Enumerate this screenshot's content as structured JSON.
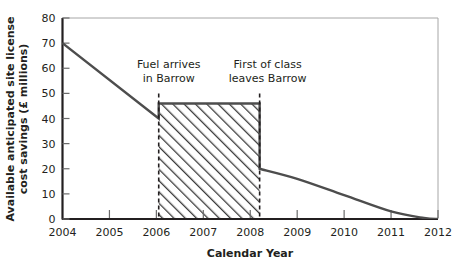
{
  "chart_data": {
    "type": "area",
    "title": "",
    "xlabel": "Calendar Year",
    "ylabel": "Available anticipated site license cost savings (£ millions)",
    "ylabel_line1": "Available anticipated site license",
    "ylabel_line2": "cost savings (£ millions)",
    "xlim": [
      2004,
      2012
    ],
    "ylim": [
      0,
      80
    ],
    "x_ticks": [
      "2004",
      "2005",
      "2006",
      "2007",
      "2008",
      "2009",
      "2010",
      "2011",
      "2012"
    ],
    "x_tick_values": [
      2004,
      2005,
      2006,
      2007,
      2008,
      2009,
      2010,
      2011,
      2012
    ],
    "y_ticks": [
      "0",
      "10",
      "20",
      "30",
      "40",
      "50",
      "60",
      "70",
      "80"
    ],
    "y_tick_values": [
      0,
      10,
      20,
      30,
      40,
      50,
      60,
      70,
      80
    ],
    "grid": false,
    "legend": "none",
    "series": [
      {
        "name": "Available anticipated site license cost savings",
        "points": [
          {
            "x": 2004,
            "y": 70
          },
          {
            "x": 2006.05,
            "y": 40
          },
          {
            "x": 2006.05,
            "y": 46
          },
          {
            "x": 2008.2,
            "y": 46
          },
          {
            "x": 2008.2,
            "y": 20
          },
          {
            "x": 2009,
            "y": 16
          },
          {
            "x": 2010,
            "y": 9.5
          },
          {
            "x": 2011,
            "y": 3
          },
          {
            "x": 2011.7,
            "y": 0.4
          },
          {
            "x": 2012,
            "y": 0
          }
        ]
      }
    ],
    "hatched_region": {
      "x_start": 2006.05,
      "x_end": 2008.2,
      "y_top": 46,
      "y_bottom": 0,
      "pattern": "diagonal-hatch-45"
    },
    "annotations": [
      {
        "id": "fuel-arrives",
        "line1": "Fuel arrives",
        "line2": "in Barrow",
        "x": 2006.05,
        "marker": "dashed-vertical",
        "marker_y_top": 50,
        "marker_y_bottom": 0
      },
      {
        "id": "first-of-class",
        "line1": "First of class",
        "line2": "leaves Barrow",
        "x": 2008.2,
        "marker": "dashed-vertical",
        "marker_y_top": 50,
        "marker_y_bottom": 0
      }
    ],
    "colors": {
      "axis": "#231f20",
      "line": "#4d4d4d",
      "hatch": "#3a3a3a",
      "background": "#ffffff",
      "frame": "#999999",
      "text": "#231f20"
    }
  }
}
